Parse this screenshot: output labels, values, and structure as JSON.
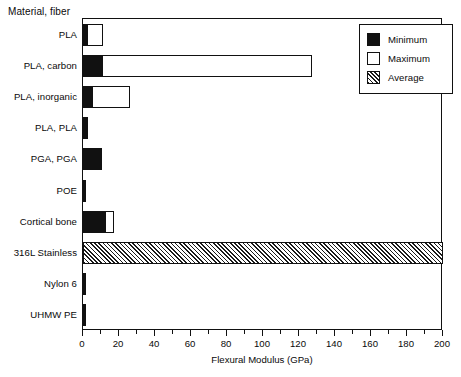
{
  "chart_data": {
    "type": "bar",
    "orientation": "horizontal",
    "title": "",
    "xlabel": "Flexural Modulus (GPa)",
    "ylabel": "Material, fiber",
    "xlim": [
      0,
      200
    ],
    "xticks": [
      0,
      20,
      40,
      60,
      80,
      100,
      120,
      140,
      160,
      180,
      200
    ],
    "xtick_labels": [
      "0",
      "20",
      "40",
      "60",
      "80",
      "100",
      "120",
      "140",
      "160",
      "180",
      "200"
    ],
    "minor_tick_step": 10,
    "grid": false,
    "legend_position": "top-right",
    "categories": [
      "PLA",
      "PLA, carbon",
      "PLA, inorganic",
      "PLA, PLA",
      "PGA, PGA",
      "POE",
      "Cortical bone",
      "316L Stainless",
      "Nylon 6",
      "UHMW PE"
    ],
    "series": [
      {
        "name": "Minimum",
        "fill": "solid-black",
        "values": [
          2.0,
          10.5,
          5.0,
          2.5,
          10.5,
          0.6,
          12.0,
          0,
          1.2,
          0.8
        ]
      },
      {
        "name": "Maximum",
        "fill": "dotted",
        "values": [
          11.0,
          127.0,
          26.0,
          2.5,
          10.5,
          0.6,
          17.0,
          0,
          1.2,
          0.8
        ]
      },
      {
        "name": "Average",
        "fill": "hatched",
        "values": [
          0,
          0,
          0,
          0,
          0,
          0,
          0,
          200.0,
          0,
          0
        ]
      }
    ],
    "bars": [
      {
        "category": "PLA",
        "minimum": 2.0,
        "maximum": 11.0,
        "average": 0
      },
      {
        "category": "PLA, carbon",
        "minimum": 10.5,
        "maximum": 127.0,
        "average": 0
      },
      {
        "category": "PLA, inorganic",
        "minimum": 5.0,
        "maximum": 26.0,
        "average": 0
      },
      {
        "category": "PLA, PLA",
        "minimum": 2.5,
        "maximum": 2.5,
        "average": 0
      },
      {
        "category": "PGA, PGA",
        "minimum": 10.5,
        "maximum": 10.5,
        "average": 0
      },
      {
        "category": "POE",
        "minimum": 0.6,
        "maximum": 0.6,
        "average": 0
      },
      {
        "category": "Cortical bone",
        "minimum": 12.0,
        "maximum": 17.0,
        "average": 0
      },
      {
        "category": "316L Stainless",
        "minimum": 0,
        "maximum": 0,
        "average": 200.0
      },
      {
        "category": "Nylon 6",
        "minimum": 1.2,
        "maximum": 1.2,
        "average": 0
      },
      {
        "category": "UHMW PE",
        "minimum": 0.8,
        "maximum": 0.8,
        "average": 0
      }
    ]
  },
  "legend": {
    "entries": [
      {
        "label": "Minimum",
        "swatch": "solid-black-swatch"
      },
      {
        "label": "Maximum",
        "swatch": "dotted-swatch"
      },
      {
        "label": "Average",
        "swatch": "hatched-swatch"
      }
    ]
  },
  "colors": {
    "foreground": "#111111",
    "background": "#ffffff"
  }
}
